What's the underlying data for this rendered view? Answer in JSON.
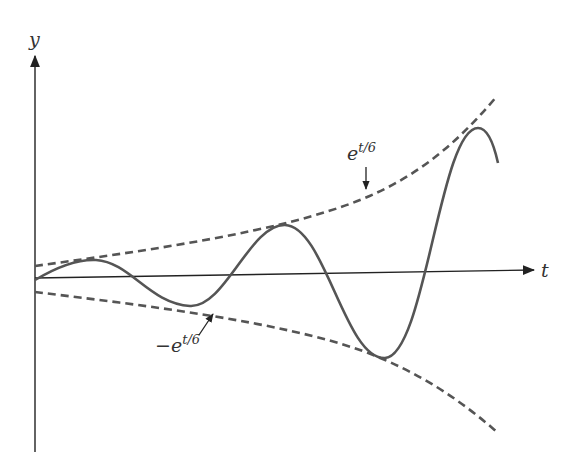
{
  "diagram": {
    "axes": {
      "x_label": "t",
      "y_label": "y"
    },
    "curves": [
      {
        "name": "upper-envelope",
        "label": "e",
        "label_exponent": "t/6",
        "style": "dashed"
      },
      {
        "name": "lower-envelope",
        "label": "−e",
        "label_exponent": "t/6",
        "style": "dashed"
      },
      {
        "name": "solution",
        "style": "solid"
      }
    ],
    "colors": {
      "axis": "#222222",
      "curve": "#555555",
      "text": "#333333"
    }
  }
}
